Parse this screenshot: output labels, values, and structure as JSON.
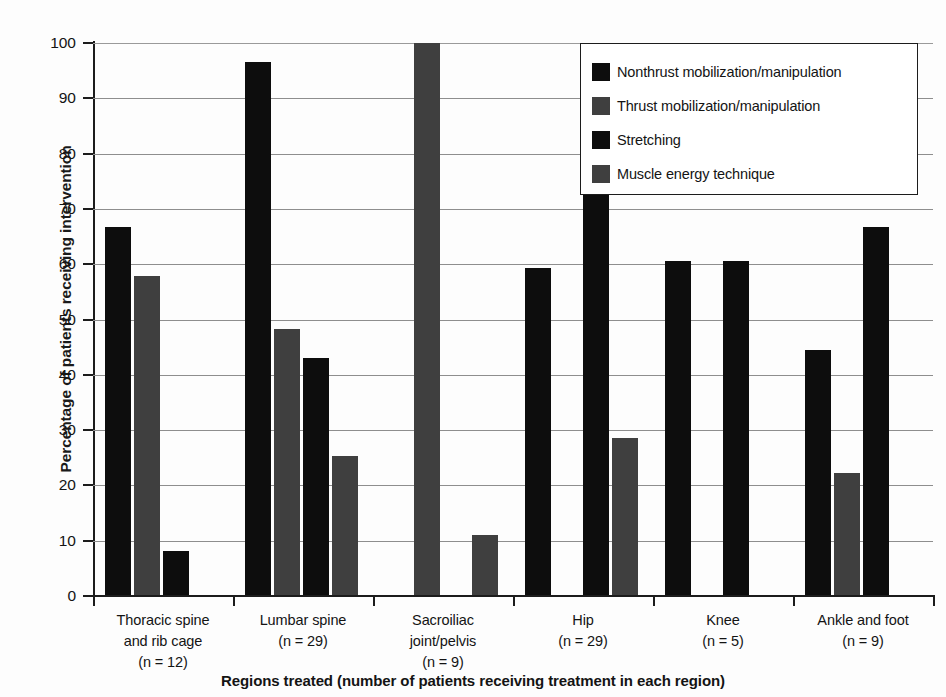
{
  "chart_data": {
    "type": "bar",
    "title": "",
    "xlabel": "Regions treated (number of patients receiving treatment in each region)",
    "ylabel": "Percentage of patients receiving intervention",
    "ylim": [
      0,
      100
    ],
    "ytick_step": 10,
    "yticks": [
      "0",
      "10",
      "20",
      "30",
      "40",
      "50",
      "60",
      "70",
      "80",
      "90",
      "100"
    ],
    "grid": true,
    "legend_position": "top-right",
    "categories": [
      "Thoracic spine and rib cage (n = 12)",
      "Lumbar spine (n = 29)",
      "Sacroiliac joint/pelvis (n = 9)",
      "Hip (n = 29)",
      "Knee (n = 5)",
      "Ankle and foot (n = 9)"
    ],
    "category_lines": [
      [
        "Thoracic spine",
        "and rib cage",
        "(n = 12)"
      ],
      [
        "Lumbar spine",
        "(n = 29)"
      ],
      [
        "Sacroiliac",
        "joint/pelvis",
        "(n = 9)"
      ],
      [
        "Hip",
        "(n = 29)"
      ],
      [
        "Knee",
        "(n = 5)"
      ],
      [
        "Ankle and foot",
        "(n = 9)"
      ]
    ],
    "series": [
      {
        "name": "Nonthrust mobilization/manipulation",
        "color": "#0d0d0d",
        "values": [
          66.7,
          96.6,
          0,
          59.3,
          60.5,
          44.4
        ]
      },
      {
        "name": "Thrust mobilization/manipulation",
        "color": "#3f3f3f",
        "values": [
          57.8,
          48.3,
          100,
          0,
          0,
          22.2
        ]
      },
      {
        "name": "Stretching",
        "color": "#0d0d0d",
        "values": [
          8.1,
          43.1,
          0,
          93.1,
          60.5,
          66.7
        ]
      },
      {
        "name": "Muscle energy technique",
        "color": "#3f3f3f",
        "values": [
          0,
          25.3,
          11.1,
          28.6,
          0,
          0
        ]
      }
    ]
  },
  "legend": {
    "items": [
      {
        "label": "Nonthrust mobilization/manipulation",
        "color": "#0d0d0d"
      },
      {
        "label": "Thrust mobilization/manipulation",
        "color": "#3f3f3f"
      },
      {
        "label": "Stretching",
        "color": "#0d0d0d"
      },
      {
        "label": "Muscle energy technique",
        "color": "#3f3f3f"
      }
    ]
  }
}
